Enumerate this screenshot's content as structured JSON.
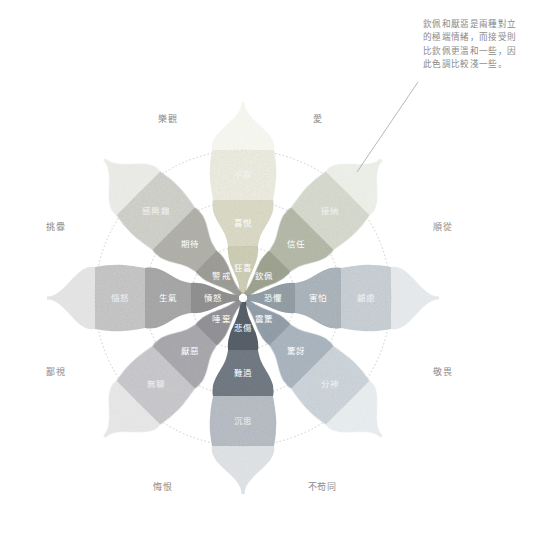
{
  "diagram": {
    "type": "plutchik-wheel-of-emotions",
    "title": "",
    "language": "zh-Hant",
    "center": {
      "x": 243,
      "y": 298
    },
    "rings": [
      {
        "name": "inner-ring",
        "radius": 52
      },
      {
        "name": "middle-ring",
        "radius": 98
      },
      {
        "name": "outer-ring",
        "radius": 148
      }
    ],
    "petals": [
      {
        "id": "joy",
        "angle_deg": -90,
        "color_intense": "#cfcfb4",
        "color_mid": "#dcdcc6",
        "color_light": "#efefe2",
        "outer_label": "",
        "levels": [
          {
            "tier": "intense",
            "label": "狂喜"
          },
          {
            "tier": "basic",
            "label": "喜悅"
          },
          {
            "tier": "mild",
            "label": "平靜"
          }
        ]
      },
      {
        "id": "trust",
        "angle_deg": -45,
        "color_intense": "#9aa08c",
        "color_mid": "#b3b8a6",
        "color_light": "#d8dccf",
        "outer_label": "",
        "levels": [
          {
            "tier": "intense",
            "label": "欽佩"
          },
          {
            "tier": "basic",
            "label": "信任"
          },
          {
            "tier": "mild",
            "label": "接納"
          }
        ]
      },
      {
        "id": "fear",
        "angle_deg": 0,
        "color_intense": "#8e9aa2",
        "color_mid": "#a9b3ba",
        "color_light": "#c9d1d6",
        "outer_label": "",
        "levels": [
          {
            "tier": "intense",
            "label": "恐懼"
          },
          {
            "tier": "basic",
            "label": "害怕"
          },
          {
            "tier": "mild",
            "label": "顧慮"
          }
        ]
      },
      {
        "id": "surprise",
        "angle_deg": 45,
        "color_intense": "#8d9aa6",
        "color_mid": "#a8b4bf",
        "color_light": "#cdd6dd",
        "outer_label": "",
        "levels": [
          {
            "tier": "intense",
            "label": "震驚"
          },
          {
            "tier": "basic",
            "label": "驚訝"
          },
          {
            "tier": "mild",
            "label": "分神"
          }
        ]
      },
      {
        "id": "sadness",
        "angle_deg": 90,
        "color_intense": "#4d5560",
        "color_mid": "#6a727d",
        "color_light": "#b6bcc4",
        "outer_label": "",
        "levels": [
          {
            "tier": "intense",
            "label": "悲傷"
          },
          {
            "tier": "basic",
            "label": "難過"
          },
          {
            "tier": "mild",
            "label": "沉思"
          }
        ]
      },
      {
        "id": "disgust",
        "angle_deg": 135,
        "color_intense": "#8d8d92",
        "color_mid": "#a6a6ab",
        "color_light": "#c9c9cd",
        "outer_label": "",
        "levels": [
          {
            "tier": "intense",
            "label": "唾棄"
          },
          {
            "tier": "basic",
            "label": "厭惡"
          },
          {
            "tier": "mild",
            "label": "無聊"
          }
        ]
      },
      {
        "id": "anger",
        "angle_deg": 180,
        "color_intense": "#8c8c8c",
        "color_mid": "#a5a5a5",
        "color_light": "#c6c6c6",
        "outer_label": "",
        "levels": [
          {
            "tier": "intense",
            "label": "憤怒"
          },
          {
            "tier": "basic",
            "label": "生氣"
          },
          {
            "tier": "mild",
            "label": "惱怒"
          }
        ]
      },
      {
        "id": "anticipation",
        "angle_deg": -135,
        "color_intense": "#9a9a93",
        "color_mid": "#b0b0a8",
        "color_light": "#d2d2cb",
        "outer_label": "",
        "levels": [
          {
            "tier": "intense",
            "label": "警戒"
          },
          {
            "tier": "basic",
            "label": "期待"
          },
          {
            "tier": "mild",
            "label": "感興趣"
          }
        ]
      }
    ],
    "dyads": [
      {
        "id": "optimism",
        "label": "樂觀",
        "x": 168,
        "y": 119
      },
      {
        "id": "love",
        "label": "愛",
        "x": 318,
        "y": 119
      },
      {
        "id": "submission",
        "label": "順從",
        "x": 443,
        "y": 227
      },
      {
        "id": "awe",
        "label": "敬畏",
        "x": 443,
        "y": 372
      },
      {
        "id": "disapproval",
        "label": "不苟同",
        "x": 322,
        "y": 487
      },
      {
        "id": "remorse",
        "label": "悔恨",
        "x": 163,
        "y": 487
      },
      {
        "id": "contempt",
        "label": "鄙視",
        "x": 56,
        "y": 372
      },
      {
        "id": "aggressiveness",
        "label": "挑釁",
        "x": 56,
        "y": 227
      }
    ],
    "annotation": {
      "lines": [
        "欽佩和厭惡是兩種對立",
        "的極端情緒，而接受則",
        "比欽佩更溫和一些，因",
        "此色調比較淺一些。"
      ],
      "leader_from": {
        "x": 418,
        "y": 82
      },
      "leader_to": {
        "x": 357,
        "y": 172
      }
    }
  }
}
